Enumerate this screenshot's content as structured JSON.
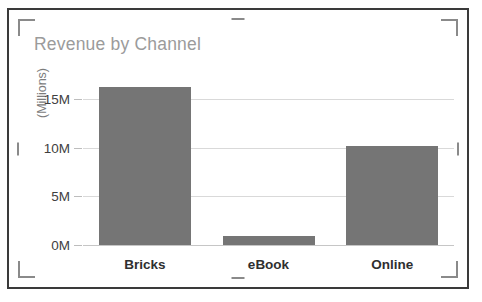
{
  "chart_object": {
    "selection_handles": {
      "corner_top_left": "corner-bracket",
      "corner_top_right": "corner-bracket",
      "corner_bottom_left": "corner-bracket",
      "corner_bottom_right": "corner-bracket",
      "edge_top": "resize-handle",
      "edge_bottom": "resize-handle",
      "edge_left": "resize-handle",
      "edge_right": "resize-handle"
    },
    "frame_color": "#3a3a3a",
    "handle_color": "#8a8a8a"
  },
  "chart_data": {
    "type": "bar",
    "title": "Revenue by Channel",
    "categories": [
      "Bricks",
      "eBook",
      "Online"
    ],
    "values": [
      16.3,
      0.9,
      10.2
    ],
    "xlabel": "",
    "ylabel": "(Millions)",
    "ylim": [
      0,
      17
    ],
    "yticks": [
      0,
      5,
      10,
      15
    ],
    "ytick_labels": [
      "0M",
      "5M",
      "10M",
      "15M"
    ],
    "grid": true,
    "legend": false,
    "bar_color": "#757575",
    "title_color": "#9b9b9b",
    "gridline_color": "#d9d9d9",
    "axis_label_color": "#3f3f3f",
    "category_label_color": "#2f2f2f"
  }
}
